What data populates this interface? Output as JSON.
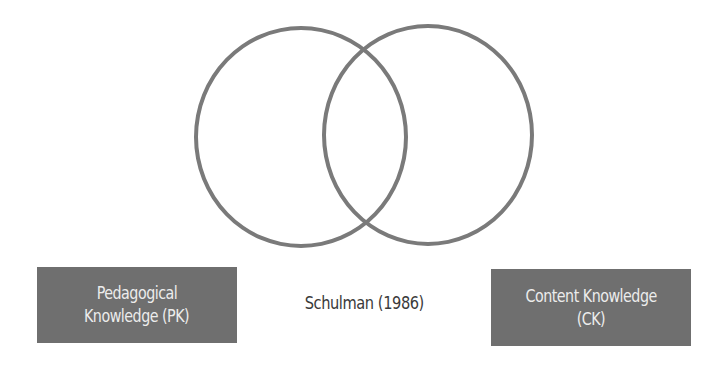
{
  "diagram": {
    "type": "venn",
    "colors": {
      "circle_stroke": "#7a7a7a",
      "box_fill": "#6f6f6f",
      "box_text": "#ececec",
      "caption_text": "#3a3a3a",
      "background": "#ffffff"
    },
    "circles": [
      {
        "id": "left",
        "represents": "Pedagogical Knowledge (PK)"
      },
      {
        "id": "right",
        "represents": "Content Knowledge (CK)"
      }
    ],
    "labels": {
      "left": {
        "line1": "Pedagogical",
        "line2": "Knowledge (PK)"
      },
      "right": {
        "line1": "Content Knowledge",
        "line2": "(CK)"
      }
    },
    "caption": "Schulman (1986)"
  }
}
